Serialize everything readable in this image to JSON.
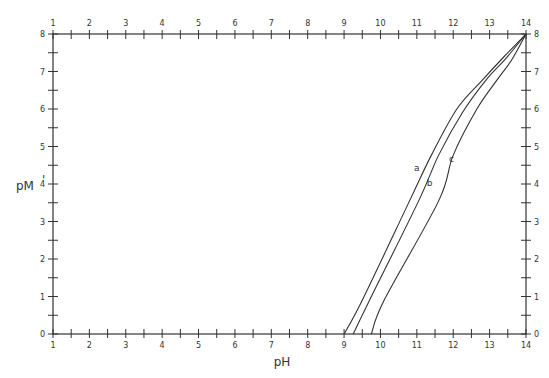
{
  "chart_data": {
    "type": "line",
    "title": "",
    "xlabel": "pH",
    "ylabel": "pM'",
    "xlim": [
      1,
      14
    ],
    "ylim": [
      0,
      8
    ],
    "x_ticks": [
      1,
      2,
      3,
      4,
      5,
      6,
      7,
      8,
      9,
      10,
      11,
      12,
      13,
      14
    ],
    "y_ticks": [
      0,
      1,
      2,
      3,
      4,
      5,
      6,
      7,
      8
    ],
    "tick_labels_on_all_sides": true,
    "grid": false,
    "legend": "inline curve labels",
    "series": [
      {
        "name": "a",
        "label_pos": {
          "x": 11.0,
          "y": 4.35
        },
        "points": [
          [
            9.0,
            0
          ],
          [
            9.5,
            0.9
          ],
          [
            10.8,
            3.55
          ],
          [
            11.4,
            4.77
          ],
          [
            12.1,
            6.0
          ],
          [
            12.8,
            6.77
          ],
          [
            13.4,
            7.4
          ],
          [
            14,
            8
          ]
        ]
      },
      {
        "name": "b",
        "label_pos": {
          "x": 11.35,
          "y": 3.95
        },
        "points": [
          [
            9.25,
            0
          ],
          [
            9.7,
            0.9
          ],
          [
            11.05,
            3.55
          ],
          [
            11.6,
            4.77
          ],
          [
            12.25,
            5.9
          ],
          [
            12.9,
            6.77
          ],
          [
            13.45,
            7.35
          ],
          [
            14,
            8
          ]
        ]
      },
      {
        "name": "c",
        "label_pos": {
          "x": 11.95,
          "y": 4.6
        },
        "points": [
          [
            9.75,
            0
          ],
          [
            10.1,
            0.9
          ],
          [
            11.6,
            3.55
          ],
          [
            12.0,
            4.77
          ],
          [
            12.65,
            6.0
          ],
          [
            13.2,
            6.77
          ],
          [
            13.6,
            7.3
          ],
          [
            14,
            8
          ]
        ]
      }
    ]
  },
  "axes": {
    "x_label": "pH",
    "y_label_main": "pM",
    "y_label_prime": "'"
  }
}
